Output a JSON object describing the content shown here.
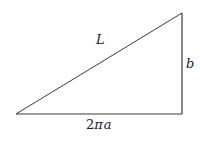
{
  "diagram": {
    "type": "right-triangle",
    "stroke_color": "#3a3a3a",
    "background": "#ffffff",
    "vertices": {
      "bottom_left": [
        16,
        114
      ],
      "bottom_right": [
        182,
        114
      ],
      "top_right": [
        182,
        13
      ]
    },
    "labels": {
      "hypotenuse": "L",
      "vertical_side": "b",
      "base_prefix": "2",
      "base_pi": "π",
      "base_var": "a"
    }
  }
}
